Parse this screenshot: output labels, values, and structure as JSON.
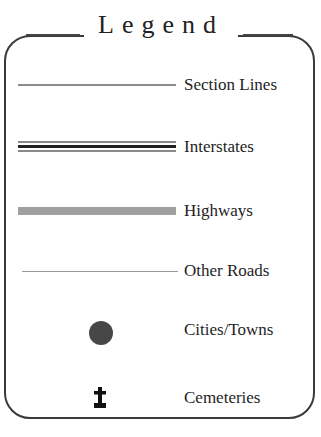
{
  "legend": {
    "title": "Legend",
    "items": [
      {
        "label": "Section Lines",
        "symbol": "thin-gray-line",
        "color": "#8c8c8c"
      },
      {
        "label": "Interstates",
        "symbol": "triple-line",
        "color": "#222222"
      },
      {
        "label": "Highways",
        "symbol": "thick-gray-line",
        "color": "#9f9f9f"
      },
      {
        "label": "Other Roads",
        "symbol": "hairline",
        "color": "#9a9a9a"
      },
      {
        "label": "Cities/Towns",
        "symbol": "filled-circle",
        "color": "#474747"
      },
      {
        "label": "Cemeteries",
        "symbol": "cross-headstone",
        "color": "#111111"
      }
    ]
  }
}
